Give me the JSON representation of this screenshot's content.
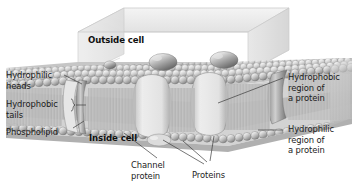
{
  "figure": {
    "title_visible": false,
    "type": "cell-membrane-cross-section",
    "style": "grayscale-3d-illustration",
    "background_color": "#ffffff"
  },
  "inline_labels": {
    "outside_cell": "Outside cell",
    "inside_cell": "Inside cell"
  },
  "callouts": {
    "hydrophilic_heads": "Hydrophilic\nheads",
    "hydrophobic_tails": "Hydrophobic\ntails",
    "phospholipid": "Phospholipid",
    "channel_protein": "Channel\nprotein",
    "proteins": "Proteins",
    "hydrophobic_region": "Hydrophobic\nregion of\na protein",
    "hydrophilic_region": "Hydrophilic\nregion of\na protein"
  },
  "colors": {
    "text": "#1b1b1b",
    "leader_line": "#3c3c3c",
    "membrane_light": "#d7d7d7",
    "membrane_mid": "#b4b4b4",
    "membrane_dark": "#8a8a8a",
    "box_face": "#e8e8e8",
    "box_edge": "#b9b9b9",
    "protein_fill": "#dcdcdc",
    "band_fill": "#cfcfcf"
  },
  "structures": [
    {
      "name": "phospholipid-bilayer",
      "description": "two rows of spherical heads with hair-like tails between"
    },
    {
      "name": "channel-protein",
      "description": "narrow vertical pore spanning the bilayer on the left"
    },
    {
      "name": "integral-protein-center",
      "description": "large rounded protein spanning bilayer at center"
    },
    {
      "name": "integral-protein-right",
      "description": "rounded protein spanning bilayer right of center"
    },
    {
      "name": "peripheral-protein",
      "description": "small protein attached on inside-cell surface"
    },
    {
      "name": "surface-sphere-left",
      "description": "large sphere resting on outer leaflet"
    },
    {
      "name": "surface-sphere-right",
      "description": "large sphere resting on outer leaflet"
    },
    {
      "name": "transparent-box",
      "description": "3D open box outlining the cell volume above the membrane"
    }
  ]
}
